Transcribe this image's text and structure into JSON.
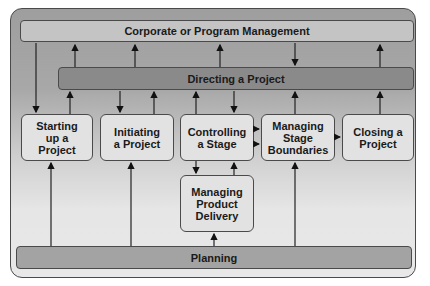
{
  "diagram": {
    "top_bar": "Corporate or Program Management",
    "directing_bar": "Directing a Project",
    "bottom_bar": "Planning",
    "processes": [
      {
        "id": "starting",
        "label": "Starting\nup a\nProject"
      },
      {
        "id": "initiating",
        "label": "Initiating\na Project"
      },
      {
        "id": "controlling",
        "label": "Controlling\na Stage"
      },
      {
        "id": "managing-boundaries",
        "label": "Managing\nStage\nBoundaries"
      },
      {
        "id": "closing",
        "label": "Closing a\nProject"
      },
      {
        "id": "managing-delivery",
        "label": "Managing\nProduct\nDelivery"
      }
    ],
    "colors": {
      "top_bar": "#c4c4c4",
      "directing_bar": "#8a8a8a",
      "bottom_bar": "#a3a3a3",
      "process_box": "#e2e2e2",
      "border": "#4a4a4a"
    }
  }
}
